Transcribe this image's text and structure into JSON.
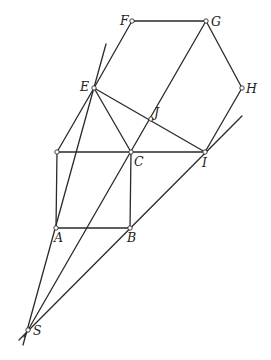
{
  "diagram": {
    "type": "geometry-construction",
    "points": {
      "F": {
        "x": 132,
        "y": 21,
        "label": "F",
        "lx": -12,
        "ly": 4
      },
      "G": {
        "x": 206,
        "y": 21,
        "label": "G",
        "lx": 5,
        "ly": 5
      },
      "E": {
        "x": 94,
        "y": 88,
        "label": "E",
        "lx": -14,
        "ly": 3
      },
      "H": {
        "x": 242,
        "y": 88,
        "label": "H",
        "lx": 4,
        "ly": 5
      },
      "J": {
        "x": 151,
        "y": 119,
        "label": "J",
        "lx": 3,
        "ly": -2
      },
      "P": {
        "x": 57,
        "y": 152,
        "label": "",
        "lx": 0,
        "ly": 0
      },
      "C": {
        "x": 131,
        "y": 152,
        "label": "C",
        "lx": 3,
        "ly": 14
      },
      "I": {
        "x": 205,
        "y": 152,
        "label": "I",
        "lx": -3,
        "ly": 15
      },
      "A": {
        "x": 56,
        "y": 228,
        "label": "A",
        "lx": -2,
        "ly": 14
      },
      "B": {
        "x": 130,
        "y": 228,
        "label": "B",
        "lx": -3,
        "ly": 14
      },
      "S": {
        "x": 28,
        "y": 330,
        "label": "S",
        "lx": 5,
        "ly": 5
      }
    },
    "segments": [
      {
        "name": "FG",
        "x1": 132,
        "y1": 21,
        "x2": 206,
        "y2": 21
      },
      {
        "name": "FE",
        "x1": 132,
        "y1": 21,
        "x2": 94,
        "y2": 88
      },
      {
        "name": "GH",
        "x1": 206,
        "y1": 21,
        "x2": 242,
        "y2": 88
      },
      {
        "name": "HI",
        "x1": 242,
        "y1": 88,
        "x2": 205,
        "y2": 152
      },
      {
        "name": "EI",
        "x1": 94,
        "y1": 88,
        "x2": 205,
        "y2": 152
      },
      {
        "name": "EC",
        "x1": 94,
        "y1": 88,
        "x2": 131,
        "y2": 152
      },
      {
        "name": "EP",
        "x1": 94,
        "y1": 88,
        "x2": 57,
        "y2": 152
      },
      {
        "name": "PI",
        "x1": 57,
        "y1": 152,
        "x2": 205,
        "y2": 152
      },
      {
        "name": "PA",
        "x1": 57,
        "y1": 152,
        "x2": 56,
        "y2": 228
      },
      {
        "name": "CB",
        "x1": 131,
        "y1": 152,
        "x2": 130,
        "y2": 228
      },
      {
        "name": "AB",
        "x1": 56,
        "y1": 228,
        "x2": 130,
        "y2": 228
      },
      {
        "name": "ray-S-A-E",
        "x1": 23,
        "y1": 345,
        "x2": 106,
        "y2": 44
      },
      {
        "name": "ray-S-C-J-G",
        "x1": 24,
        "y1": 337,
        "x2": 206,
        "y2": 21
      },
      {
        "name": "ray-S-B-I",
        "x1": 19,
        "y1": 340,
        "x2": 242,
        "y2": 116
      }
    ]
  }
}
